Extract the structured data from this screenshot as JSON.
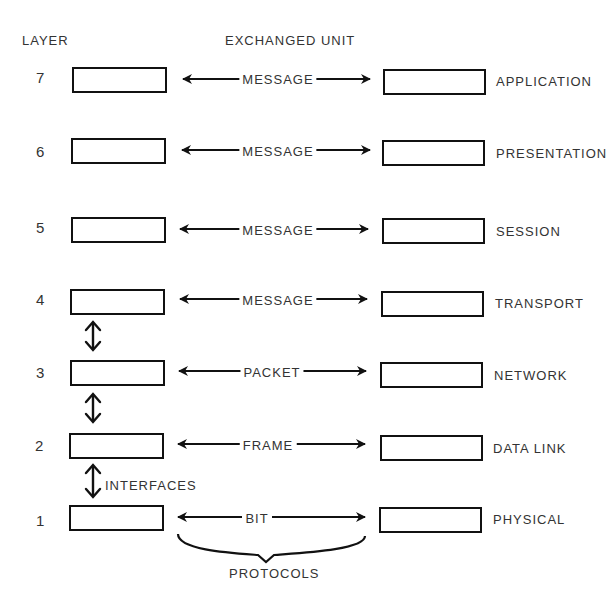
{
  "headers": {
    "layer": "LAYER",
    "exchanged_unit": "EXCHANGED UNIT"
  },
  "layers": [
    {
      "number": "7",
      "unit": "MESSAGE",
      "name": "APPLICATION"
    },
    {
      "number": "6",
      "unit": "MESSAGE",
      "name": "PRESENTATION"
    },
    {
      "number": "5",
      "unit": "MESSAGE",
      "name": "SESSION"
    },
    {
      "number": "4",
      "unit": "MESSAGE",
      "name": "TRANSPORT"
    },
    {
      "number": "3",
      "unit": "PACKET",
      "name": "NETWORK"
    },
    {
      "number": "2",
      "unit": "FRAME",
      "name": "DATA LINK"
    },
    {
      "number": "1",
      "unit": "BIT",
      "name": "PHYSICAL"
    }
  ],
  "annotations": {
    "interfaces": "INTERFACES",
    "protocols": "PROTOCOLS"
  }
}
